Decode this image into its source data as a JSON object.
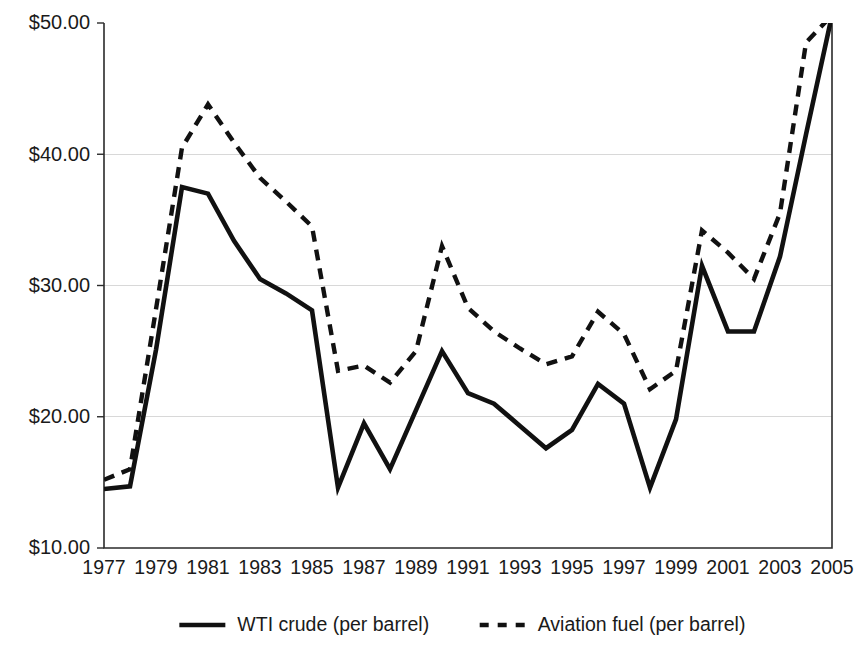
{
  "chart_data": {
    "type": "line",
    "title": "",
    "subtitle": "",
    "xlabel": "",
    "ylabel": "",
    "xlim": [
      1977,
      2005
    ],
    "ylim": [
      10,
      50
    ],
    "grid": true,
    "legend_position": "bottom",
    "y_tick_labels": [
      "$50.00",
      "$40.00",
      "$30.00",
      "$20.00",
      "$10.00"
    ],
    "y_ticks": [
      50,
      40,
      30,
      20,
      10
    ],
    "x_tick_labels": [
      "1977",
      "1979",
      "1981",
      "1983",
      "1985",
      "1987",
      "1989",
      "1991",
      "1993",
      "1995",
      "1997",
      "1999",
      "2001",
      "2003",
      "2005"
    ],
    "x_ticks": [
      1977,
      1979,
      1981,
      1983,
      1985,
      1987,
      1989,
      1991,
      1993,
      1995,
      1997,
      1999,
      2001,
      2003,
      2005
    ],
    "x": [
      1977,
      1978,
      1979,
      1980,
      1981,
      1982,
      1983,
      1984,
      1985,
      1986,
      1987,
      1988,
      1989,
      1990,
      1991,
      1992,
      1993,
      1994,
      1995,
      1996,
      1997,
      1998,
      1999,
      2000,
      2001,
      2002,
      2003,
      2004,
      2005
    ],
    "series": [
      {
        "name": "WTI crude (per barrel)",
        "style": "solid",
        "color": "#111111",
        "values": [
          14.5,
          14.7,
          25.1,
          37.5,
          37.0,
          33.4,
          30.5,
          29.4,
          28.1,
          14.6,
          19.5,
          16.0,
          20.5,
          25.0,
          21.8,
          21.0,
          19.3,
          17.6,
          19.0,
          22.5,
          21.0,
          14.6,
          19.8,
          31.5,
          26.5,
          26.5,
          32.2,
          41.5,
          50.6
        ]
      },
      {
        "name": "Aviation fuel (per barrel)",
        "style": "dashed",
        "color": "#111111",
        "values": [
          15.2,
          16.0,
          28.2,
          40.5,
          43.8,
          40.9,
          38.2,
          36.4,
          34.5,
          23.5,
          23.9,
          22.6,
          25.0,
          33.0,
          28.3,
          26.5,
          25.2,
          24.0,
          24.6,
          28.0,
          26.3,
          22.1,
          23.5,
          34.2,
          32.5,
          30.5,
          35.5,
          48.5,
          50.6
        ]
      }
    ]
  },
  "legend": {
    "items": [
      {
        "label": "WTI crude (per barrel)",
        "style": "solid"
      },
      {
        "label": "Aviation fuel (per barrel)",
        "style": "dashed"
      }
    ]
  }
}
